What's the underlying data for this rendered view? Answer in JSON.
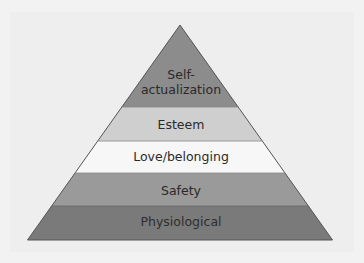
{
  "diagram": {
    "type": "pyramid",
    "title": "",
    "levels": [
      {
        "label_line1": "Self-",
        "label_line2": "actualization",
        "color": "#8c8c8c"
      },
      {
        "label": "Esteem",
        "color": "#cfcfcf"
      },
      {
        "label": "Love/belonging",
        "color": "#f7f7f7"
      },
      {
        "label": "Safety",
        "color": "#9a9a9a"
      },
      {
        "label": "Physiological",
        "color": "#7a7a7a"
      }
    ]
  }
}
